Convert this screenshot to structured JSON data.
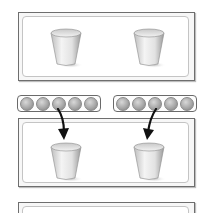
{
  "panels": [
    {
      "id": "top",
      "cups": 2,
      "arrows": false
    },
    {
      "id": "middle",
      "cups": 2,
      "arrows": true
    },
    {
      "id": "bottom",
      "cups": 0,
      "arrows": false
    }
  ],
  "trays": [
    {
      "id": "left",
      "balls": 5
    },
    {
      "id": "right",
      "balls": 5
    }
  ],
  "colors": {
    "frame": "#6e6e6e",
    "ball": "#a8a8a8",
    "arrow": "#111111"
  }
}
